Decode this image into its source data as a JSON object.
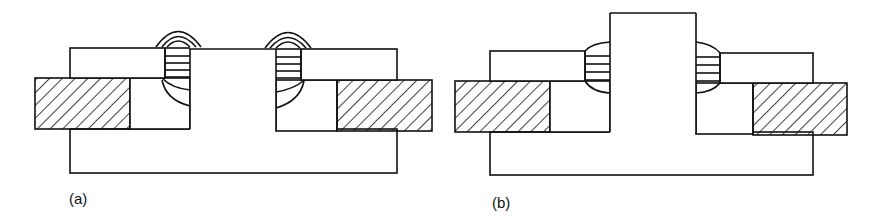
{
  "figure": {
    "panels": [
      {
        "id": "a",
        "label": "(a)",
        "description": "Cross-section of a joint: central stem flush with upper plates, welds at both sides of the stem with cap beads above the surface and fusion zones extending into the lower (hatched) plates",
        "weld_style": "cap bead above surface with curved fusion lines below"
      },
      {
        "id": "b",
        "label": "(b)",
        "description": "Cross-section of a joint: central stem protrudes above the upper plates, welds at both sides of the stem with lens-shaped fusion zones",
        "weld_style": "lens-shaped fillet between stem and upper plates"
      }
    ],
    "colors": {
      "stroke": "#111111",
      "background": "#ffffff",
      "hatch": "#111111"
    }
  }
}
